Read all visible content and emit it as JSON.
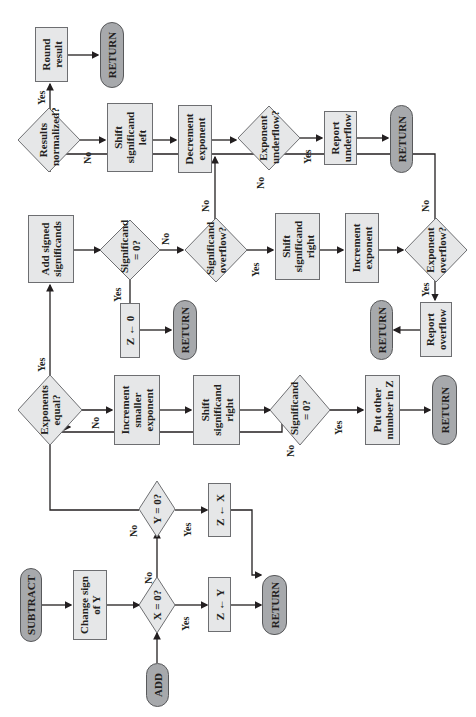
{
  "diagram": {
    "orientation": "rotated 90 degrees counter-clockwise",
    "colors": {
      "process_fill": "#e6e7e8",
      "terminal_fill": "#a7a9ac",
      "decision_fill": "#e6e7e8",
      "stroke": "#6d6e71",
      "line": "#231f20"
    },
    "nodes": {
      "subtract": "SUBTRACT",
      "add": "ADD",
      "change_sign": "Change sign of Y",
      "x_zero": "X = 0?",
      "y_zero": "Y = 0?",
      "z_y": "Z ← Y",
      "z_x": "Z ← X",
      "return_1": "RETURN",
      "exp_equal": "Exponents equal?",
      "inc_smaller": "Increment smaller exponent",
      "shift_right_1": "Shift significand right",
      "sig_zero_1": "Significand = 0?",
      "put_other": "Put other number in Z",
      "return_2": "RETURN",
      "add_signed": "Add signed significands",
      "sig_zero_2": "Significand = 0?",
      "z_zero": "Z ← 0",
      "return_3": "RETURN",
      "sig_overflow": "Significand overflow?",
      "shift_right_2": "Shift significand right",
      "inc_exp": "Increment exponent",
      "exp_overflow": "Exponent overflow?",
      "report_overflow": "Report overflow",
      "return_4": "RETURN",
      "results_norm": "Results normalized?",
      "round": "Round result",
      "return_5": "RETURN",
      "shift_left": "Shift significand left",
      "dec_exp": "Decrement exponent",
      "exp_underflow": "Exponent underflow?",
      "report_underflow": "Report underflow",
      "return_6": "RETURN"
    },
    "edge_labels": {
      "yes": "Yes",
      "no": "No"
    }
  }
}
